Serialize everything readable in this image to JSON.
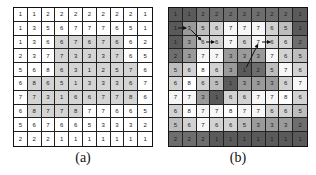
{
  "figure_a": {
    "caption": "(a)",
    "shade_color": "#d4d4d4",
    "values": [
      [
        1,
        1,
        2,
        2,
        2,
        2,
        2,
        2,
        2,
        1
      ],
      [
        1,
        3,
        5,
        6,
        7,
        7,
        7,
        6,
        5,
        1
      ],
      [
        1,
        3,
        6,
        6,
        7,
        6,
        7,
        6,
        6,
        2
      ],
      [
        2,
        3,
        7,
        7,
        3,
        3,
        3,
        7,
        6,
        5
      ],
      [
        5,
        6,
        8,
        6,
        3,
        1,
        2,
        5,
        7,
        6
      ],
      [
        6,
        8,
        6,
        5,
        1,
        3,
        3,
        3,
        6,
        7
      ],
      [
        7,
        7,
        3,
        1,
        6,
        6,
        7,
        7,
        8,
        6
      ],
      [
        6,
        8,
        7,
        7,
        8,
        7,
        7,
        6,
        6,
        5
      ],
      [
        5,
        6,
        7,
        6,
        6,
        5,
        3,
        3,
        3,
        2
      ],
      [
        2,
        2,
        2,
        1,
        1,
        1,
        1,
        1,
        1,
        1
      ]
    ],
    "shaded": [
      [
        0,
        0,
        0,
        0,
        0,
        0,
        0,
        0,
        0,
        0
      ],
      [
        0,
        0,
        0,
        0,
        0,
        0,
        0,
        0,
        0,
        0
      ],
      [
        0,
        0,
        0,
        1,
        1,
        1,
        1,
        1,
        0,
        0
      ],
      [
        0,
        0,
        0,
        1,
        1,
        1,
        1,
        1,
        0,
        0
      ],
      [
        0,
        0,
        0,
        1,
        1,
        1,
        1,
        1,
        1,
        0
      ],
      [
        0,
        1,
        1,
        1,
        1,
        1,
        1,
        1,
        1,
        0
      ],
      [
        0,
        1,
        1,
        1,
        1,
        1,
        1,
        1,
        1,
        0
      ],
      [
        0,
        1,
        1,
        1,
        1,
        0,
        0,
        0,
        0,
        0
      ],
      [
        0,
        0,
        0,
        0,
        0,
        0,
        0,
        0,
        0,
        0
      ],
      [
        0,
        0,
        0,
        0,
        0,
        0,
        0,
        0,
        0,
        0
      ]
    ]
  },
  "figure_b": {
    "caption": "(b)",
    "value_colors": {
      "1": "#5a5a5a",
      "2": "#6e6e6e",
      "3": "#9a9a9a",
      "5": "#bdbdbd",
      "6": "#d2d2d2",
      "7": "#f6f6f6",
      "8": "#ffffff"
    },
    "values": [
      [
        1,
        1,
        2,
        2,
        2,
        2,
        2,
        2,
        2,
        1
      ],
      [
        1,
        3,
        5,
        6,
        7,
        7,
        7,
        6,
        5,
        1
      ],
      [
        1,
        3,
        6,
        6,
        7,
        6,
        7,
        6,
        6,
        2
      ],
      [
        2,
        3,
        7,
        7,
        3,
        3,
        3,
        7,
        6,
        5
      ],
      [
        5,
        6,
        8,
        6,
        3,
        1,
        2,
        5,
        7,
        6
      ],
      [
        6,
        8,
        6,
        5,
        1,
        3,
        3,
        3,
        6,
        7
      ],
      [
        7,
        7,
        3,
        1,
        6,
        6,
        7,
        7,
        8,
        6
      ],
      [
        6,
        8,
        7,
        7,
        8,
        7,
        7,
        6,
        6,
        5
      ],
      [
        5,
        6,
        7,
        6,
        6,
        5,
        3,
        3,
        3,
        2
      ],
      [
        2,
        2,
        2,
        1,
        1,
        1,
        1,
        1,
        1,
        1
      ]
    ],
    "arrows": [
      {
        "from": [
          1,
          0
        ],
        "to": [
          1,
          1
        ]
      },
      {
        "from": [
          1,
          1
        ],
        "to": [
          2,
          2
        ]
      },
      {
        "from": [
          2,
          2
        ],
        "to": [
          2,
          3
        ]
      },
      {
        "from": [
          2,
          6
        ],
        "to": [
          2,
          7
        ]
      },
      {
        "from": [
          4,
          5
        ],
        "to": [
          2,
          6
        ]
      }
    ]
  }
}
